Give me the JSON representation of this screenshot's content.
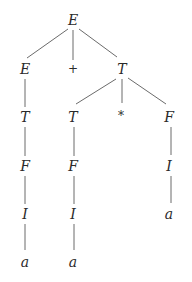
{
  "diagram": {
    "type": "parse-tree",
    "colors": {
      "text": "#2a2a2a",
      "edge": "#6b6b6b",
      "background": "#ffffff"
    },
    "nodes": [
      {
        "id": "n0",
        "label": "E",
        "x": 73,
        "y": 20,
        "kind": "nonterminal"
      },
      {
        "id": "n1",
        "label": "E",
        "x": 25,
        "y": 69,
        "kind": "nonterminal"
      },
      {
        "id": "n2",
        "label": "+",
        "x": 73,
        "y": 69,
        "kind": "operator"
      },
      {
        "id": "n3",
        "label": "T",
        "x": 122,
        "y": 69,
        "kind": "nonterminal"
      },
      {
        "id": "n4",
        "label": "T",
        "x": 25,
        "y": 117,
        "kind": "nonterminal"
      },
      {
        "id": "n5",
        "label": "T",
        "x": 73,
        "y": 117,
        "kind": "nonterminal"
      },
      {
        "id": "n6",
        "label": "*",
        "x": 121,
        "y": 116,
        "kind": "operator"
      },
      {
        "id": "n7",
        "label": "F",
        "x": 169,
        "y": 117,
        "kind": "nonterminal"
      },
      {
        "id": "n8",
        "label": "F",
        "x": 25,
        "y": 166,
        "kind": "nonterminal"
      },
      {
        "id": "n9",
        "label": "F",
        "x": 73,
        "y": 166,
        "kind": "nonterminal"
      },
      {
        "id": "n10",
        "label": "I",
        "x": 169,
        "y": 166,
        "kind": "nonterminal"
      },
      {
        "id": "n11",
        "label": "I",
        "x": 25,
        "y": 214,
        "kind": "nonterminal"
      },
      {
        "id": "n12",
        "label": "I",
        "x": 73,
        "y": 214,
        "kind": "nonterminal"
      },
      {
        "id": "n13",
        "label": "a",
        "x": 169,
        "y": 214,
        "kind": "terminal"
      },
      {
        "id": "n14",
        "label": "a",
        "x": 25,
        "y": 262,
        "kind": "terminal"
      },
      {
        "id": "n15",
        "label": "a",
        "x": 73,
        "y": 262,
        "kind": "terminal"
      }
    ],
    "edges": [
      {
        "from": "n0",
        "to": "n1",
        "x1": 68,
        "y1": 29,
        "x2": 27,
        "y2": 58
      },
      {
        "from": "n0",
        "to": "n2",
        "x1": 73,
        "y1": 30,
        "x2": 73,
        "y2": 60
      },
      {
        "from": "n0",
        "to": "n3",
        "x1": 79,
        "y1": 29,
        "x2": 117,
        "y2": 57
      },
      {
        "from": "n1",
        "to": "n4",
        "x1": 25,
        "y1": 79,
        "x2": 25,
        "y2": 107
      },
      {
        "from": "n3",
        "to": "n5",
        "x1": 116,
        "y1": 79,
        "x2": 76,
        "y2": 104
      },
      {
        "from": "n3",
        "to": "n6",
        "x1": 122,
        "y1": 79,
        "x2": 122,
        "y2": 103
      },
      {
        "from": "n3",
        "to": "n7",
        "x1": 128,
        "y1": 78,
        "x2": 166,
        "y2": 104
      },
      {
        "from": "n4",
        "to": "n8",
        "x1": 25,
        "y1": 127,
        "x2": 25,
        "y2": 156
      },
      {
        "from": "n5",
        "to": "n9",
        "x1": 74,
        "y1": 127,
        "x2": 74,
        "y2": 156
      },
      {
        "from": "n7",
        "to": "n10",
        "x1": 171,
        "y1": 127,
        "x2": 171,
        "y2": 155
      },
      {
        "from": "n8",
        "to": "n11",
        "x1": 25,
        "y1": 176,
        "x2": 25,
        "y2": 204
      },
      {
        "from": "n9",
        "to": "n12",
        "x1": 74,
        "y1": 176,
        "x2": 74,
        "y2": 204
      },
      {
        "from": "n10",
        "to": "n13",
        "x1": 171,
        "y1": 176,
        "x2": 171,
        "y2": 203
      },
      {
        "from": "n11",
        "to": "n14",
        "x1": 25,
        "y1": 224,
        "x2": 25,
        "y2": 250
      },
      {
        "from": "n12",
        "to": "n15",
        "x1": 74,
        "y1": 224,
        "x2": 74,
        "y2": 250
      }
    ]
  }
}
